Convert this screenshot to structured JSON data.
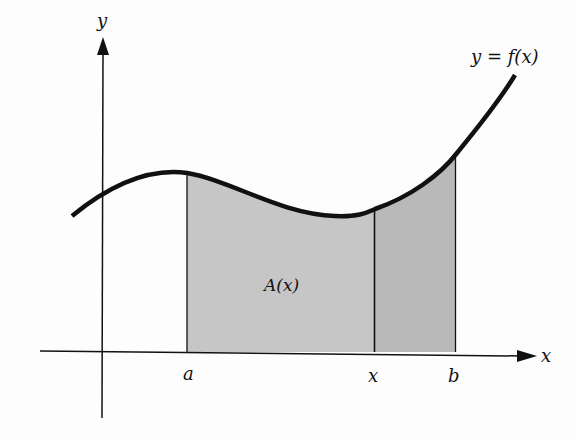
{
  "figure": {
    "curve_label": "y = f(x)",
    "area_label": "A(x)",
    "axes": {
      "x_label": "x",
      "y_label": "y"
    },
    "tick_labels": {
      "a": "a",
      "x": "x",
      "b": "b"
    },
    "colors": {
      "curve": "#111111",
      "axis": "#111111",
      "area_fill": "#c6c6c6",
      "extra_fill": "#b9b9b9",
      "background": "#fdfdfd"
    }
  }
}
